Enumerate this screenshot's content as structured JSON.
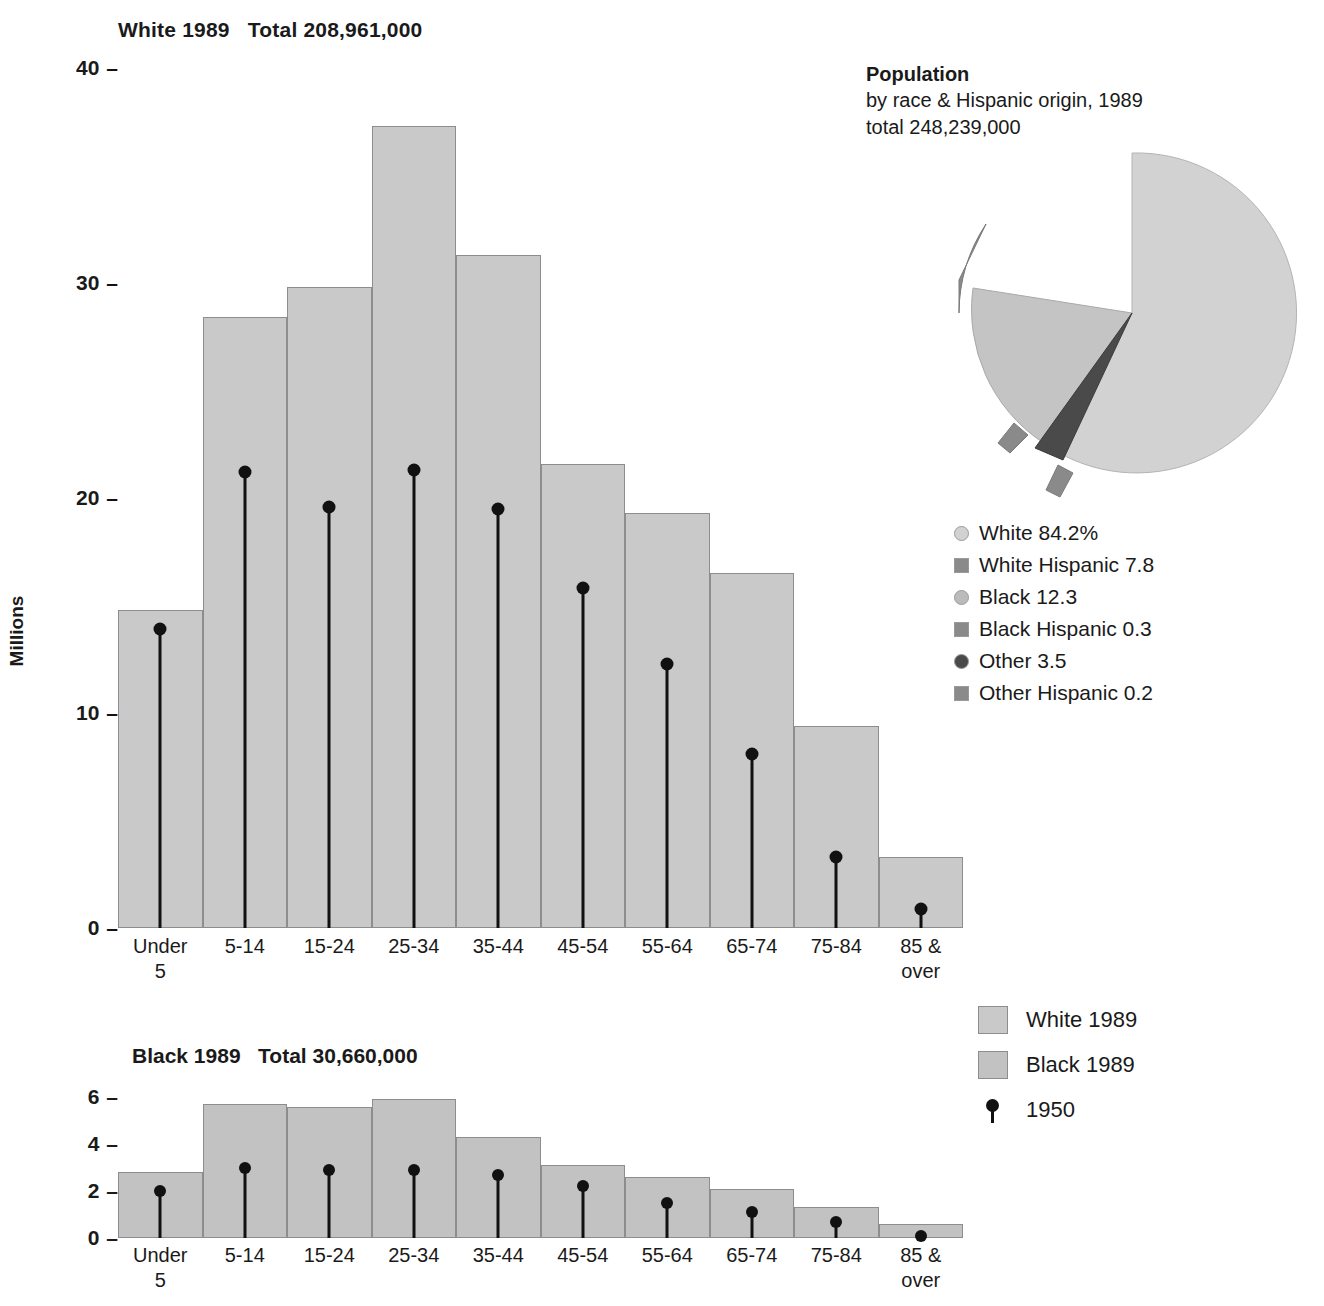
{
  "chart_data": [
    {
      "type": "bar",
      "id": "white-1989",
      "title": "White 1989   Total 208,961,000",
      "title_parts": {
        "series": "White 1989",
        "total": "Total 208,961,000"
      },
      "ylabel": "Millions",
      "xlabel": "",
      "ylim": [
        0,
        40
      ],
      "yticks": [
        0,
        10,
        20,
        30,
        40
      ],
      "ytick_labels": [
        "0",
        "10",
        "20",
        "30",
        "40"
      ],
      "grid": false,
      "categories": [
        "Under\n5",
        "5-14",
        "15-24",
        "25-34",
        "35-44",
        "45-54",
        "55-64",
        "65-74",
        "75-84",
        "85 &\nover"
      ],
      "series": [
        {
          "name": "White 1989",
          "values": [
            14.8,
            28.4,
            29.8,
            37.3,
            31.3,
            21.6,
            19.3,
            16.5,
            9.4,
            3.3
          ]
        },
        {
          "name": "1950",
          "values": [
            13.9,
            21.2,
            19.6,
            21.3,
            19.5,
            15.8,
            12.3,
            8.1,
            3.3,
            0.9
          ]
        }
      ]
    },
    {
      "type": "bar",
      "id": "black-1989",
      "title": "Black 1989   Total 30,660,000",
      "title_parts": {
        "series": "Black 1989",
        "total": "Total 30,660,000"
      },
      "ylabel": "",
      "xlabel": "",
      "ylim": [
        0,
        6.6
      ],
      "yticks": [
        0,
        2,
        4,
        6
      ],
      "ytick_labels": [
        "0",
        "2",
        "4",
        "6"
      ],
      "grid": false,
      "categories": [
        "Under\n5",
        "5-14",
        "15-24",
        "25-34",
        "35-44",
        "45-54",
        "55-64",
        "65-74",
        "75-84",
        "85 &\nover"
      ],
      "series": [
        {
          "name": "Black 1989",
          "values": [
            2.8,
            5.7,
            5.6,
            5.9,
            4.3,
            3.1,
            2.6,
            2.1,
            1.3,
            0.6
          ]
        },
        {
          "name": "1950",
          "values": [
            2.0,
            3.0,
            2.9,
            2.9,
            2.7,
            2.2,
            1.5,
            1.1,
            0.7,
            0.1
          ]
        }
      ]
    },
    {
      "type": "pie",
      "id": "population-by-race",
      "title": "Population",
      "subtitle_line1": "by race & Hispanic origin, 1989",
      "subtitle_line2": "total 248,239,000",
      "labels": [
        "White",
        "White Hispanic",
        "Black",
        "Black Hispanic",
        "Other",
        "Other Hispanic"
      ],
      "values": [
        84.2,
        7.8,
        12.3,
        0.3,
        3.5,
        0.2
      ],
      "legend_position": "below",
      "legend_entries": [
        {
          "label": "White 84.2%",
          "marker": "circle",
          "color": "#d2d2d2"
        },
        {
          "label": "White Hispanic 7.8",
          "marker": "square",
          "color": "#8a8a8a"
        },
        {
          "label": "Black 12.3",
          "marker": "circle",
          "color": "#bbbbbb"
        },
        {
          "label": "Black Hispanic 0.3",
          "marker": "square",
          "color": "#8a8a8a"
        },
        {
          "label": "Other 3.5",
          "marker": "circle",
          "color": "#4a4a4a"
        },
        {
          "label": "Other Hispanic 0.2",
          "marker": "square",
          "color": "#8a8a8a"
        }
      ]
    }
  ],
  "series_legend": [
    {
      "label": "White 1989",
      "marker": "swatch",
      "color": "#c9c9c9"
    },
    {
      "label": "Black 1989",
      "marker": "swatch",
      "color": "#c2c2c2"
    },
    {
      "label": "1950",
      "marker": "pin",
      "color": "#111111"
    }
  ],
  "colors": {
    "white_bar": "#c9c9c9",
    "black_bar": "#c2c2c2",
    "bar_border": "#8d8d8d",
    "marker": "#111111",
    "pie_white": "#d2d2d2",
    "pie_white_hispanic": "#8a8a8a",
    "pie_black": "#bbbbbb",
    "pie_other": "#4a4a4a",
    "text": "#1a1a1a"
  }
}
